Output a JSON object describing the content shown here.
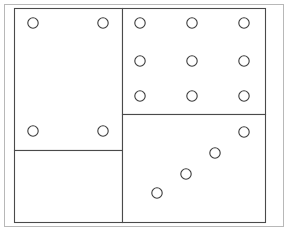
{
  "diagram": {
    "canvas": {
      "width": 296,
      "height": 237,
      "background": "#ffffff"
    },
    "colors": {
      "outer_frame_stroke": "#b8b8b8",
      "panel_stroke": "#4a4a4a",
      "node_stroke": "#3c3c3c",
      "fill": "#ffffff"
    },
    "outer_frame": {
      "label": "outer-frame",
      "x": 4,
      "y": 4,
      "width": 279,
      "height": 222,
      "stroke": "#b8b8b8",
      "stroke_width": 1
    },
    "panels": [
      {
        "name": "upper-left-panel",
        "label": "Upper Left Panel",
        "x": 14,
        "y": 8,
        "width": 108,
        "height": 142,
        "stroke": "#4a4a4a",
        "stroke_width": 1.1,
        "node_count": 4,
        "node_pattern": "corners"
      },
      {
        "name": "lower-left-panel",
        "label": "Lower Left Panel",
        "x": 14,
        "y": 150,
        "width": 108,
        "height": 72,
        "stroke": "#4a4a4a",
        "stroke_width": 1.1,
        "node_count": 0,
        "node_pattern": "empty"
      },
      {
        "name": "upper-right-panel",
        "label": "Upper Right Panel",
        "x": 122,
        "y": 8,
        "width": 143,
        "height": 106,
        "stroke": "#4a4a4a",
        "stroke_width": 1.1,
        "node_count": 9,
        "node_pattern": "grid-3x3"
      },
      {
        "name": "lower-right-panel",
        "label": "Lower Right Panel",
        "x": 122,
        "y": 114,
        "width": 143,
        "height": 108,
        "stroke": "#4a4a4a",
        "stroke_width": 1.1,
        "node_count": 4,
        "node_pattern": "diagonal"
      }
    ],
    "nodes": [
      {
        "id": "ul-1",
        "panel": "upper-left-panel",
        "cx": 33,
        "cy": 23,
        "r": 5.2
      },
      {
        "id": "ul-2",
        "panel": "upper-left-panel",
        "cx": 103,
        "cy": 23,
        "r": 5.2
      },
      {
        "id": "ul-3",
        "panel": "upper-left-panel",
        "cx": 33,
        "cy": 131,
        "r": 5.2
      },
      {
        "id": "ul-4",
        "panel": "upper-left-panel",
        "cx": 103,
        "cy": 131,
        "r": 5.2
      },
      {
        "id": "ur-1",
        "panel": "upper-right-panel",
        "cx": 140,
        "cy": 23,
        "r": 5.2
      },
      {
        "id": "ur-2",
        "panel": "upper-right-panel",
        "cx": 192,
        "cy": 23,
        "r": 5.2
      },
      {
        "id": "ur-3",
        "panel": "upper-right-panel",
        "cx": 244,
        "cy": 23,
        "r": 5.2
      },
      {
        "id": "ur-4",
        "panel": "upper-right-panel",
        "cx": 140,
        "cy": 61,
        "r": 5.2
      },
      {
        "id": "ur-5",
        "panel": "upper-right-panel",
        "cx": 192,
        "cy": 61,
        "r": 5.2
      },
      {
        "id": "ur-6",
        "panel": "upper-right-panel",
        "cx": 244,
        "cy": 61,
        "r": 5.2
      },
      {
        "id": "ur-7",
        "panel": "upper-right-panel",
        "cx": 140,
        "cy": 96,
        "r": 5.2
      },
      {
        "id": "ur-8",
        "panel": "upper-right-panel",
        "cx": 192,
        "cy": 96,
        "r": 5.2
      },
      {
        "id": "ur-9",
        "panel": "upper-right-panel",
        "cx": 244,
        "cy": 96,
        "r": 5.2
      },
      {
        "id": "lr-1",
        "panel": "lower-right-panel",
        "cx": 244,
        "cy": 132,
        "r": 5.2
      },
      {
        "id": "lr-2",
        "panel": "lower-right-panel",
        "cx": 215,
        "cy": 153,
        "r": 5.2
      },
      {
        "id": "lr-3",
        "panel": "lower-right-panel",
        "cx": 186,
        "cy": 174,
        "r": 5.2
      },
      {
        "id": "lr-4",
        "panel": "lower-right-panel",
        "cx": 157,
        "cy": 193,
        "r": 5.2
      }
    ]
  }
}
